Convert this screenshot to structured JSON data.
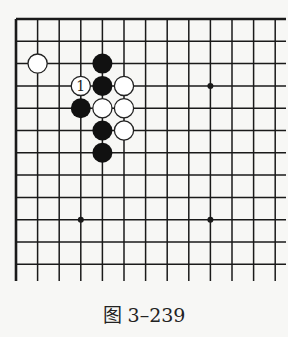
{
  "diagram": {
    "type": "go-board-fragment",
    "caption": "图 3–239",
    "grid": {
      "columns": 13,
      "rows": 12,
      "open_edges": [
        "right",
        "bottom"
      ]
    },
    "star_points": [
      [
        9,
        3
      ],
      [
        3,
        9
      ],
      [
        9,
        9
      ]
    ],
    "stones": [
      {
        "color": "white",
        "col": 1,
        "row": 2,
        "label": ""
      },
      {
        "color": "black",
        "col": 4,
        "row": 2,
        "label": ""
      },
      {
        "color": "white",
        "col": 3,
        "row": 3,
        "label": "1"
      },
      {
        "color": "black",
        "col": 4,
        "row": 3,
        "label": ""
      },
      {
        "color": "white",
        "col": 5,
        "row": 3,
        "label": ""
      },
      {
        "color": "black",
        "col": 3,
        "row": 4,
        "label": ""
      },
      {
        "color": "white",
        "col": 4,
        "row": 4,
        "label": ""
      },
      {
        "color": "white",
        "col": 5,
        "row": 4,
        "label": ""
      },
      {
        "color": "black",
        "col": 4,
        "row": 5,
        "label": ""
      },
      {
        "color": "white",
        "col": 5,
        "row": 5,
        "label": ""
      },
      {
        "color": "black",
        "col": 4,
        "row": 6,
        "label": ""
      }
    ],
    "colors": {
      "line": "#1a1a1a",
      "black_stone": "#111111",
      "white_stone": "#ffffff",
      "background": "#f7f7f5"
    }
  }
}
